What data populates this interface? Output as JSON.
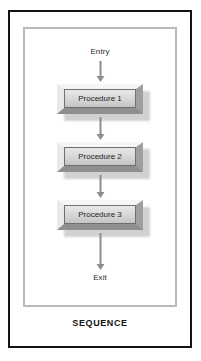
{
  "figure": {
    "caption": "SEQUENCE",
    "frame_color": "#b9b9b9",
    "border_color": "#141414",
    "arrow_color": "#8d8d8d",
    "box_face_color": "#d6d6d6",
    "text_color": "#1d1d1d"
  },
  "diagram": {
    "type": "flowchart",
    "entry_label": "Entry",
    "exit_label": "Exit",
    "steps": [
      {
        "label": "Procedure 1"
      },
      {
        "label": "Procedure 2"
      },
      {
        "label": "Procedure 3"
      }
    ],
    "arrows": [
      {
        "from": "Entry",
        "to": "Procedure 1"
      },
      {
        "from": "Procedure 1",
        "to": "Procedure 2"
      },
      {
        "from": "Procedure 2",
        "to": "Procedure 3"
      },
      {
        "from": "Procedure 3",
        "to": "Exit"
      }
    ]
  }
}
